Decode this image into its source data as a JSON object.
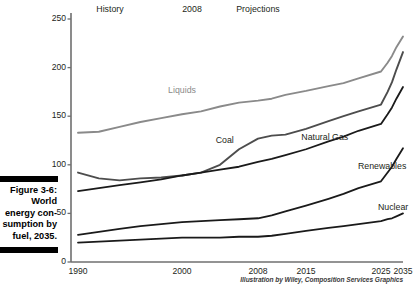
{
  "figure": {
    "caption": "Figure 3-6:\nWorld\nenergy con-\nsumption by\nfuel, 2035.",
    "credit": "Illustration by Wiley, Composition Services Graphics"
  },
  "annotations": {
    "history": "History",
    "divider_year": "2008",
    "projections": "Projections"
  },
  "chart_data": {
    "type": "line",
    "xlabel": "",
    "ylabel": "",
    "xlim": [
      1990,
      2035
    ],
    "ylim": [
      0,
      250
    ],
    "yticks": [
      0,
      50,
      100,
      150,
      200,
      250
    ],
    "xticks": [
      1990,
      2000,
      2008,
      2015,
      2025,
      2035
    ],
    "xtick_labels": [
      "1990",
      "2000",
      "2008",
      "2015",
      "2025",
      "2035"
    ],
    "ytick_labels": [
      "0",
      "50",
      "100",
      "150",
      "200",
      "250"
    ],
    "grid": false,
    "legend": "inline-labels",
    "x": [
      1990,
      1992,
      1994,
      1996,
      1998,
      2000,
      2002,
      2004,
      2006,
      2008,
      2010,
      2012,
      2015,
      2018,
      2020,
      2022,
      2025,
      2028,
      2030,
      2032,
      2035
    ],
    "series": [
      {
        "name": "Liquids",
        "color": "#8a8a8a",
        "values": [
          133,
          134,
          139,
          144,
          148,
          152,
          155,
          160,
          164,
          166,
          168,
          172,
          176,
          181,
          184,
          189,
          196,
          205,
          212,
          221,
          232
        ]
      },
      {
        "name": "Coal",
        "color": "#4d4d4d",
        "values": [
          92,
          86,
          84,
          86,
          87,
          89,
          92,
          100,
          116,
          127,
          130,
          131,
          137,
          145,
          150,
          155,
          162,
          175,
          185,
          198,
          216
        ]
      },
      {
        "name": "Natural Gas",
        "color": "#1a1a1a",
        "values": [
          73,
          76,
          79,
          82,
          85,
          89,
          92,
          95,
          98,
          103,
          106,
          110,
          116,
          124,
          129,
          135,
          142,
          152,
          159,
          168,
          180
        ]
      },
      {
        "name": "Renewables",
        "color": "#1a1a1a",
        "values": [
          28,
          31,
          34,
          37,
          39,
          41,
          42,
          43,
          44,
          45,
          48,
          52,
          58,
          65,
          70,
          76,
          83,
          92,
          98,
          106,
          117
        ]
      },
      {
        "name": "Nuclear",
        "color": "#1a1a1a",
        "values": [
          20,
          21,
          22,
          23,
          24,
          25,
          25,
          25,
          26,
          26,
          27,
          29,
          32,
          35,
          37,
          39,
          42,
          44,
          45,
          47,
          50
        ]
      }
    ],
    "series_label_positions": [
      {
        "name": "Liquids",
        "x": 2000.0,
        "y": 176
      },
      {
        "name": "Coal",
        "x": 2004.5,
        "y": 124
      },
      {
        "name": "Natural Gas",
        "x": 2017.5,
        "y": 128
      },
      {
        "name": "Renewables",
        "x": 2025.5,
        "y": 98
      },
      {
        "name": "Nuclear",
        "x": 2030.5,
        "y": 56
      }
    ]
  }
}
